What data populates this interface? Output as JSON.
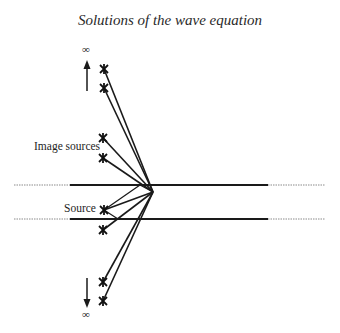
{
  "title": "Solutions of the wave equation",
  "labels": {
    "image_sources": "Image sources",
    "source": "Source",
    "infinity_top": "∞",
    "infinity_bottom": "∞"
  },
  "diagram": {
    "convergence_point": [
      153,
      192
    ],
    "boundaries": [
      {
        "y": 185,
        "solid_from": 70,
        "solid_to": 268,
        "dashed_left_from": 14,
        "dashed_right_to": 325
      },
      {
        "y": 219,
        "solid_from": 70,
        "solid_to": 268,
        "dashed_left_from": 14,
        "dashed_right_to": 325
      }
    ],
    "sources": [
      {
        "role": "image",
        "x": 104,
        "y": 69
      },
      {
        "role": "image",
        "x": 104,
        "y": 88
      },
      {
        "role": "image",
        "x": 103,
        "y": 138
      },
      {
        "role": "image",
        "x": 103,
        "y": 158
      },
      {
        "role": "source",
        "x": 104,
        "y": 210
      },
      {
        "role": "image",
        "x": 103,
        "y": 230
      },
      {
        "role": "image",
        "x": 103,
        "y": 282
      },
      {
        "role": "image",
        "x": 103,
        "y": 301
      }
    ],
    "arrows": [
      {
        "direction": "up",
        "x": 87,
        "y1": 90,
        "y2": 62
      },
      {
        "direction": "down",
        "x": 87,
        "y1": 278,
        "y2": 306
      }
    ]
  },
  "colors": {
    "ink": "#1a1a1a",
    "dashed": "#8a8a8a"
  }
}
